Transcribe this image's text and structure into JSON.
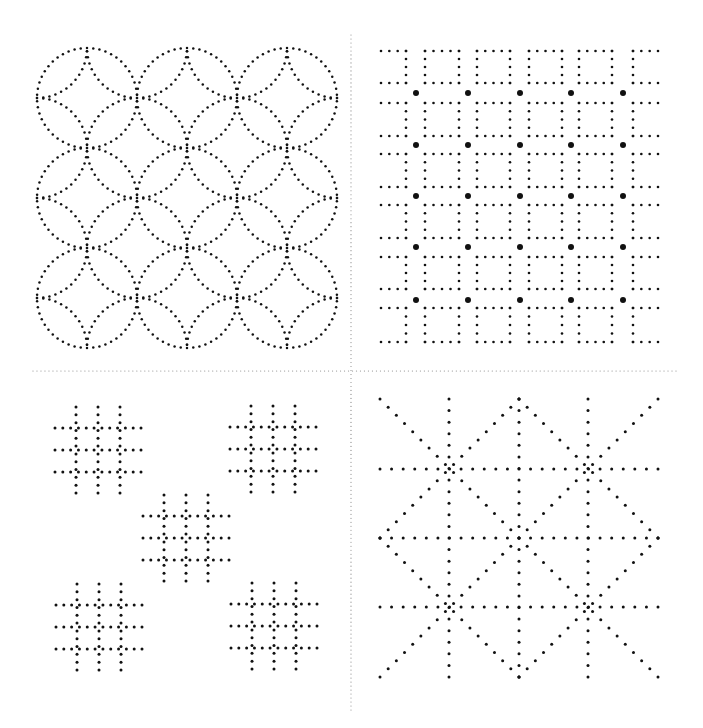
{
  "canvas": {
    "width": 703,
    "height": 728,
    "background": "#ffffff"
  },
  "colors": {
    "dot": "#111111",
    "divider": "#8a8a8a"
  },
  "dividers": {
    "horizontal": {
      "y": 371,
      "x1": 33,
      "x2": 676,
      "spacing": 4,
      "r": 0.6
    },
    "vertical": {
      "x": 351,
      "y1": 35,
      "y2": 710,
      "spacing": 4,
      "r": 0.6
    }
  },
  "patterns": {
    "top_left": {
      "name": "overlapping-circles",
      "bounds": {
        "x": 37,
        "y": 48,
        "w": 300,
        "h": 300
      },
      "cell": 100,
      "radius": 50,
      "dot_r": 1.25,
      "dot_spacing": 6.3
    },
    "top_right": {
      "name": "squares-and-dots",
      "columns": [
        {
          "type": "bracket-left",
          "x1": 381,
          "x2": 406
        },
        {
          "type": "square",
          "x1": 425,
          "x2": 459
        },
        {
          "type": "square",
          "x1": 477,
          "x2": 510
        },
        {
          "type": "square",
          "x1": 529,
          "x2": 562
        },
        {
          "type": "square",
          "x1": 579,
          "x2": 612
        },
        {
          "type": "bracket-right",
          "x1": 633,
          "x2": 658
        }
      ],
      "rows": [
        {
          "y1": 51,
          "y2": 83
        },
        {
          "y1": 103,
          "y2": 136
        },
        {
          "y1": 154,
          "y2": 187
        },
        {
          "y1": 205,
          "y2": 238
        },
        {
          "y1": 257,
          "y2": 289
        },
        {
          "y1": 308,
          "y2": 342
        }
      ],
      "big_dots_x": [
        416,
        468,
        520,
        571,
        623
      ],
      "big_dots_y": [
        93,
        145,
        196,
        247,
        300
      ],
      "dot_r": 1.3,
      "big_dot_r": 3,
      "dots_per_side": 5
    },
    "bottom_left": {
      "name": "hash-grids",
      "grids": [
        {
          "cx": 98,
          "cy": 450
        },
        {
          "cx": 273,
          "cy": 449
        },
        {
          "cx": 186,
          "cy": 538
        },
        {
          "cx": 99,
          "cy": 627
        },
        {
          "cx": 274,
          "cy": 626
        }
      ],
      "line_offsets": [
        -22,
        0,
        22
      ],
      "half_length": 43,
      "dots_per_line": 12,
      "dot_r": 1.5
    },
    "bottom_right": {
      "name": "star-lattice",
      "bounds": {
        "x1": 380,
        "y1": 399,
        "x2": 658,
        "y2": 677
      },
      "vertical_x": [
        449,
        519,
        588
      ],
      "horizontal_y": [
        469,
        538,
        607
      ],
      "dot_spacing": 11.5,
      "dot_r": 1.5
    }
  }
}
